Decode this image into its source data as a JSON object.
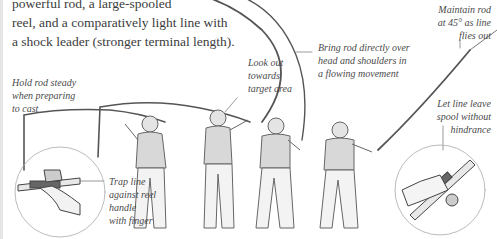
{
  "intro": {
    "lines": [
      "powerful rod, a large-spooled",
      "reel, and a comparatively light line with",
      "a shock leader (stronger terminal length)."
    ]
  },
  "captions": {
    "hold_rod": [
      "Hold rod steady",
      "when preparing",
      "to cast"
    ],
    "look_out": [
      "Look out",
      "towards",
      "target area"
    ],
    "bring_rod": [
      "Bring rod directly over",
      "head and shoulders in",
      "a flowing movement"
    ],
    "maintain_rod": [
      "Maintain rod",
      "at 45° as line",
      "flies out"
    ],
    "let_line": [
      "Let line leave",
      "spool without",
      "hindrance"
    ],
    "trap_line": [
      "Trap line",
      "against reel",
      "handle",
      "with finger"
    ]
  },
  "illustration": {
    "figures": [
      "figure-stance-1",
      "figure-stance-2",
      "figure-stance-3",
      "figure-stance-4"
    ],
    "insets": [
      "inset-trap-line",
      "inset-release-line"
    ],
    "colors": {
      "line_art": "#555555",
      "shading": "#bdbdbd",
      "background": "#ffffff"
    }
  }
}
